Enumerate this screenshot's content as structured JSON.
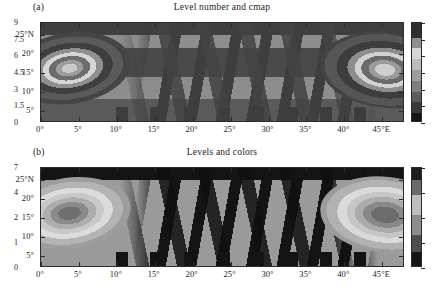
{
  "figure": {
    "width": 443,
    "height": 289,
    "background": "#ffffff",
    "panel_count": 2
  },
  "chart_data": [
    {
      "type": "heatmap",
      "panel_label": "(a)",
      "title": "Level number and cmap",
      "xlabel": "",
      "ylabel": "",
      "xlim": [
        0,
        48
      ],
      "ylim": [
        2,
        28
      ],
      "grid": false,
      "legend_position": "right-colorbar",
      "xtick_labels": [
        "0°",
        "5°",
        "10°",
        "15°",
        "20°",
        "25°",
        "30°",
        "35°",
        "40°",
        "45°E"
      ],
      "xtick_values": [
        0,
        5,
        10,
        15,
        20,
        25,
        30,
        35,
        40,
        45
      ],
      "ytick_labels": [
        "5°",
        "10°",
        "15°",
        "20°",
        "25°N"
      ],
      "ytick_values": [
        5,
        10,
        15,
        20,
        25
      ],
      "colorbar": {
        "tick_labels": [
          "0",
          "1.5",
          "3",
          "4.5",
          "6",
          "7.5",
          "9"
        ],
        "tick_values": [
          0,
          1.5,
          3,
          4.5,
          6,
          7.5,
          9
        ],
        "vmin": 0,
        "vmax": 9,
        "spacing": "uniform",
        "level_count": 9,
        "cmap": "grayscale-cyclic"
      },
      "features": [
        {
          "name": "left-vortex",
          "center_lon": 2,
          "center_lat": 8,
          "rings": 8
        },
        {
          "name": "right-vortex",
          "center_lon": 46,
          "center_lat": 8,
          "rings": 8
        },
        {
          "name": "mid-wave-field",
          "lon_range": [
            12,
            40
          ]
        }
      ]
    },
    {
      "type": "heatmap",
      "panel_label": "(b)",
      "title": "Levels and colors",
      "xlabel": "",
      "ylabel": "",
      "xlim": [
        0,
        48
      ],
      "ylim": [
        2,
        28
      ],
      "grid": false,
      "legend_position": "right-colorbar",
      "xtick_labels": [
        "0°",
        "5°",
        "10°",
        "15°",
        "20°",
        "25°",
        "30°",
        "35°",
        "40°",
        "45°E"
      ],
      "xtick_values": [
        0,
        5,
        10,
        15,
        20,
        25,
        30,
        35,
        40,
        45
      ],
      "ytick_labels": [
        "5°",
        "10°",
        "15°",
        "20°",
        "25°N"
      ],
      "ytick_values": [
        5,
        10,
        15,
        20,
        25
      ],
      "colorbar": {
        "tick_labels": [
          "0",
          "1",
          "2",
          "4",
          "7"
        ],
        "tick_values": [
          0,
          1,
          2,
          4,
          7
        ],
        "vmin": 0,
        "vmax": 7,
        "spacing": "proportional-nonuniform",
        "level_count": 5,
        "cmap": "grayscale-custom"
      },
      "features": [
        {
          "name": "left-vortex",
          "center_lon": 2,
          "center_lat": 8,
          "rings": 6
        },
        {
          "name": "right-vortex",
          "center_lon": 46,
          "center_lat": 8,
          "rings": 6
        },
        {
          "name": "mid-wave-field",
          "lon_range": [
            12,
            40
          ]
        }
      ]
    }
  ]
}
